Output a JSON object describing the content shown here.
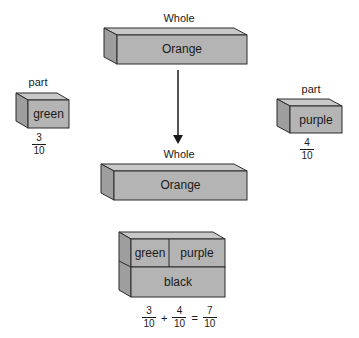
{
  "diagram": {
    "top_whole": {
      "title": "Whole",
      "box_label": "Orange"
    },
    "left_part": {
      "title": "part",
      "box_label": "green",
      "fraction": {
        "numerator": "3",
        "denominator": "10"
      }
    },
    "right_part": {
      "title": "part",
      "box_label": "purple",
      "fraction": {
        "numerator": "4",
        "denominator": "10"
      }
    },
    "bottom_whole": {
      "title": "Whole",
      "box_label": "Orange"
    },
    "stacked": {
      "top_left": "green",
      "top_right": "purple",
      "bottom": "black"
    },
    "equation": {
      "terms": [
        {
          "numerator": "3",
          "denominator": "10"
        },
        {
          "numerator": "4",
          "denominator": "10"
        },
        {
          "numerator": "7",
          "denominator": "10"
        }
      ],
      "plus": "+",
      "equals": "="
    },
    "colors": {
      "box_front": "#b4b4b4",
      "box_top": "#c8c8c8",
      "box_side": "#9e9e9e",
      "outline": "#2a2a2a"
    }
  }
}
